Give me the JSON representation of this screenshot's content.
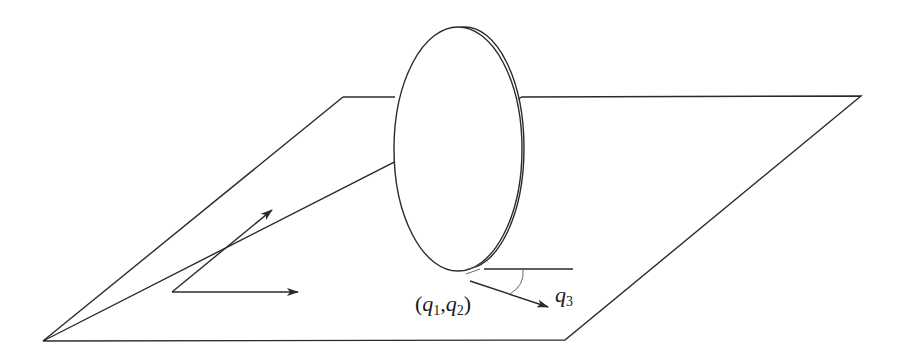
{
  "figure": {
    "labels": {
      "position_open": "(",
      "q1_symbol": "q",
      "q1_sub": "1",
      "comma": ",",
      "q2_symbol": "q",
      "q2_sub": "2",
      "position_close": ")",
      "heading_symbol": "q",
      "heading_sub": "3"
    },
    "colors": {
      "line": "#2a2a2a",
      "background": "#ffffff"
    }
  }
}
